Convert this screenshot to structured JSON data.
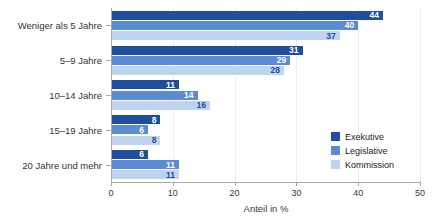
{
  "chart_data": {
    "type": "bar",
    "orientation": "horizontal",
    "title": "",
    "xlabel": "Anteil in %",
    "ylabel": "",
    "xlim": [
      0,
      50
    ],
    "xticks": [
      0,
      10,
      20,
      30,
      40,
      50
    ],
    "xtick_labels": [
      "0",
      "10",
      "20",
      "30",
      "40",
      "50"
    ],
    "grid": true,
    "legend_position": "inner-right",
    "categories": [
      "Weniger als 5 Jahre",
      "5–9 Jahre",
      "10–14 Jahre",
      "15–19 Jahre",
      "20 Jahre und mehr"
    ],
    "series": [
      {
        "name": "Exekutive",
        "color": "#1f4e9c",
        "values": [
          44,
          31,
          11,
          8,
          6
        ]
      },
      {
        "name": "Legislative",
        "color": "#5b8bd0",
        "values": [
          40,
          29,
          14,
          6,
          11
        ]
      },
      {
        "name": "Kommission",
        "color": "#bed4ee",
        "values": [
          37,
          28,
          16,
          8,
          11
        ]
      }
    ],
    "data_labels": [
      [
        "44",
        "40",
        "37"
      ],
      [
        "31",
        "29",
        "28"
      ],
      [
        "11",
        "14",
        "16"
      ],
      [
        "8",
        "6",
        "8"
      ],
      [
        "6",
        "11",
        "11"
      ]
    ]
  },
  "colors": {
    "series_dark": "#1f4e9c",
    "series_medium": "#5b8bd0",
    "series_light": "#bed4ee",
    "axis": "#a9a9a9",
    "grid": "#e9eef5",
    "text": "#333333",
    "background": "#ffffff"
  }
}
